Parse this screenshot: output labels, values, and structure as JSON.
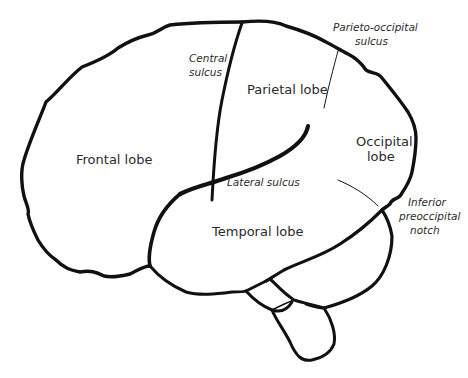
{
  "diagram": {
    "lobes": [
      {
        "id": "frontal",
        "label": "Frontal lobe"
      },
      {
        "id": "parietal",
        "label": "Parietal lobe"
      },
      {
        "id": "occipital",
        "label_line1": "Occipital",
        "label_line2": "lobe"
      },
      {
        "id": "temporal",
        "label": "Temporal lobe"
      }
    ],
    "landmarks": [
      {
        "id": "central-sulcus",
        "line1": "Central",
        "line2": "sulcus"
      },
      {
        "id": "parieto-occipital-sulcus",
        "line1": "Parieto-occipital",
        "line2": "sulcus"
      },
      {
        "id": "lateral-sulcus",
        "line1": "Lateral sulcus"
      },
      {
        "id": "inferior-preoccipital-notch",
        "line1": "Inferior",
        "line2": "preoccipital",
        "line3": "notch"
      }
    ],
    "colors": {
      "stroke": "#111111",
      "text": "#2a2a2a",
      "background": "#ffffff"
    }
  }
}
